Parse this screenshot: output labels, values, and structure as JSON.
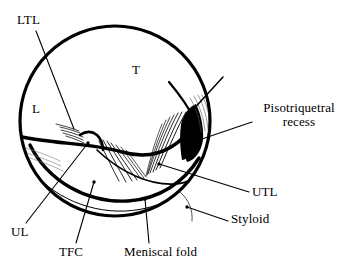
{
  "figure": {
    "kind": "anatomical-line-drawing",
    "colors": {
      "ink": "#000000",
      "background": "#ffffff",
      "fill_recess": "#000000",
      "fiber_gray": "#6a6a6a"
    },
    "labels": [
      {
        "id": "ltl",
        "text": "LTL",
        "meaning": "lunotriquetral ligament",
        "kind": "leader-label",
        "x": 17,
        "y": 13,
        "leader": {
          "from_x": 36,
          "from_y": 31,
          "to_x": 74,
          "to_y": 129
        }
      },
      {
        "id": "t",
        "text": "T",
        "meaning": "triquetrum",
        "kind": "region-label",
        "x": 132,
        "y": 63,
        "leader": null
      },
      {
        "id": "l",
        "text": "L",
        "meaning": "lunate",
        "kind": "region-label",
        "x": 32,
        "y": 102,
        "leader": null
      },
      {
        "id": "pisotriquetral-recess",
        "text": "Pisotriquetral recess",
        "line1": "Pisotriquetral",
        "line2": "recess",
        "kind": "leader-label",
        "x": 254,
        "y": 101,
        "leader": {
          "from_x": 252,
          "from_y": 122,
          "to_x": 196,
          "to_y": 141
        }
      },
      {
        "id": "utl",
        "text": "UTL",
        "meaning": "ulnotriquetral ligament",
        "kind": "leader-label",
        "x": 252,
        "y": 185,
        "leader": {
          "from_x": 249,
          "from_y": 192,
          "to_x": 159,
          "to_y": 164
        }
      },
      {
        "id": "styloid",
        "text": "Styloid",
        "meaning": "ulnar styloid",
        "kind": "leader-label",
        "x": 231,
        "y": 212,
        "leader": {
          "from_x": 228,
          "from_y": 221,
          "to_x": 187,
          "to_y": 207
        }
      },
      {
        "id": "ul",
        "text": "UL",
        "meaning": "ulnolunate ligament",
        "kind": "leader-label",
        "x": 11,
        "y": 225,
        "leader": {
          "from_x": 26,
          "from_y": 223,
          "to_x": 88,
          "to_y": 143
        }
      },
      {
        "id": "tfc",
        "text": "TFC",
        "meaning": "triangular fibrocartilage",
        "kind": "leader-label",
        "x": 59,
        "y": 245,
        "leader": {
          "from_x": 76,
          "from_y": 243,
          "to_x": 94,
          "to_y": 182
        }
      },
      {
        "id": "meniscal-fold",
        "text": "Meniscal fold",
        "kind": "leader-label",
        "x": 124,
        "y": 245,
        "leader": {
          "from_x": 149,
          "from_y": 243,
          "to_x": 145,
          "to_y": 199
        }
      }
    ],
    "geometry": {
      "scope_circle": {
        "cx": 115,
        "cy": 121,
        "r": 95,
        "stroke_width": 3
      },
      "recess_fill_note": "solid black wedge at right of field",
      "meniscal_arc_note": "thick crescent sweeping from left edge down across bottom to right"
    }
  }
}
